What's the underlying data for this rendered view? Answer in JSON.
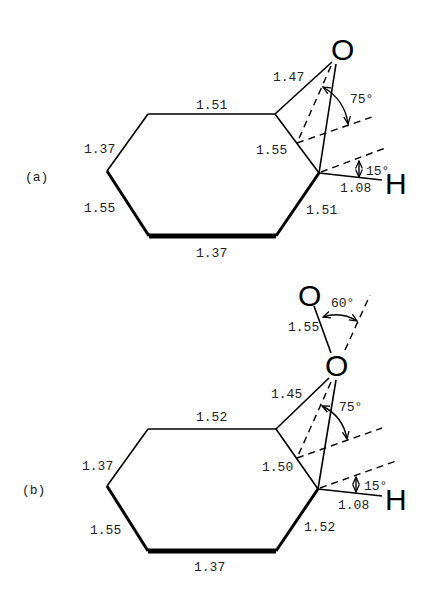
{
  "panels": [
    {
      "id": "a",
      "label": "(a)",
      "atoms": {
        "oxygen": "O",
        "hydrogen": "H"
      },
      "bond_lengths": {
        "top": "1.51",
        "upper_left": "1.37",
        "lower_left": "1.55",
        "bottom": "1.37",
        "lower_right": "1.51",
        "upper_right": "1.55",
        "c_o": "1.47",
        "c_h": "1.08"
      },
      "angles": {
        "o_tilt": "75°",
        "h_tilt": "15°"
      }
    },
    {
      "id": "b",
      "label": "(b)",
      "atoms": {
        "oxygen_outer": "O",
        "oxygen_inner": "O",
        "hydrogen": "H"
      },
      "bond_lengths": {
        "top": "1.52",
        "upper_left": "1.37",
        "lower_left": "1.55",
        "bottom": "1.37",
        "lower_right": "1.52",
        "upper_right": "1.50",
        "c_o": "1.45",
        "o_o": "1.55",
        "c_h": "1.08"
      },
      "angles": {
        "oo_tilt": "60°",
        "o_tilt": "75°",
        "h_tilt": "15°"
      }
    }
  ]
}
